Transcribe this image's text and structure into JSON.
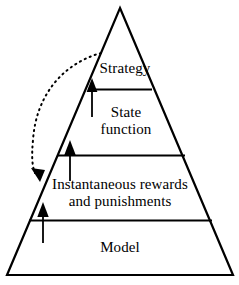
{
  "diagram": {
    "type": "pyramid-hierarchy",
    "title": "",
    "background_color": "#ffffff",
    "stroke_color": "#000000",
    "tiers": [
      {
        "id": "strategy",
        "label": "Strategy",
        "level": 1,
        "position": "apex"
      },
      {
        "id": "state-function",
        "label": "State\nfunction",
        "level": 2,
        "position": "upper-middle"
      },
      {
        "id": "instantaneous-rewards-and-punishments",
        "label": "Instantaneous rewards\nand punishments",
        "level": 3,
        "position": "lower-middle"
      },
      {
        "id": "model",
        "label": "Model",
        "level": 4,
        "position": "base"
      }
    ],
    "arrows": [
      {
        "id": "arrow-model-to-rewards",
        "style": "solid",
        "direction": "up",
        "from_tier": "model",
        "to_tier": "instantaneous-rewards-and-punishments"
      },
      {
        "id": "arrow-rewards-to-state-function",
        "style": "solid",
        "direction": "up",
        "from_tier": "instantaneous-rewards-and-punishments",
        "to_tier": "state-function"
      },
      {
        "id": "arrow-state-function-to-strategy",
        "style": "solid",
        "direction": "up",
        "from_tier": "state-function",
        "to_tier": "strategy"
      },
      {
        "id": "arrow-feedback-strategy-to-rewards",
        "style": "dotted-curved",
        "direction": "down-left-then-down-right",
        "from_tier": "strategy",
        "to_tier": "instantaneous-rewards-and-punishments"
      }
    ]
  }
}
